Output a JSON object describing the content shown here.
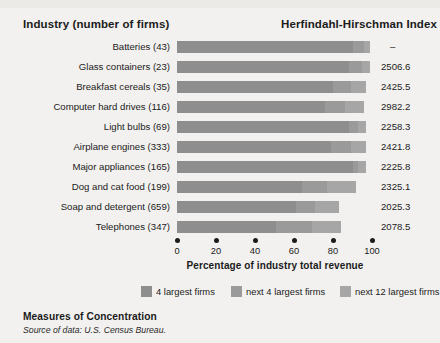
{
  "header": {
    "left": "Industry (number of firms)",
    "right": "Herfindahl-Hirschman Index"
  },
  "caption": {
    "title": "Measures of Concentration",
    "source": "Source of data: U.S. Census Bureau."
  },
  "axis": {
    "title": "Percentage of industry total revenue",
    "ticks": [
      "0",
      "20",
      "40",
      "60",
      "80",
      "100"
    ]
  },
  "legend": {
    "items": [
      {
        "label": "4 largest firms",
        "color": "#8e8e8e"
      },
      {
        "label": "next 4 largest firms",
        "color": "#9a9a9a"
      },
      {
        "label": "next 12 largest firms",
        "color": "#a6a6a6"
      }
    ]
  },
  "chart_data": {
    "type": "bar",
    "subtype": "stacked-horizontal",
    "title": "Measures of Concentration",
    "xlabel": "Percentage of industry total revenue",
    "ylabel": "Industry (number of firms)",
    "xlim": [
      0,
      100
    ],
    "xticks": [
      0,
      20,
      40,
      60,
      80,
      100
    ],
    "grid": false,
    "legend_position": "bottom",
    "categories": [
      "Batteries  (43)",
      "Glass containers  (23)",
      "Breakfast cereals  (35)",
      "Computer hard drives  (116)",
      "Light bulbs  (69)",
      "Airplane engines  (333)",
      "Major appliances  (165)",
      "Dog and cat food  (199)",
      "Soap and detergent  (659)",
      "Telephones  (347)"
    ],
    "series": [
      {
        "name": "4 largest firms",
        "values": [
          90,
          88,
          80,
          76,
          88,
          79,
          90,
          64,
          61,
          51
        ]
      },
      {
        "name": "next 4 largest firms",
        "values": [
          6,
          7,
          9,
          10,
          5,
          10,
          3,
          13,
          10,
          18
        ]
      },
      {
        "name": "next 12 largest firms",
        "values": [
          3,
          4,
          8,
          10,
          4,
          8,
          4,
          15,
          12,
          15
        ]
      }
    ],
    "rows": [
      {
        "industry": "Batteries",
        "firms": "43",
        "s1": 90,
        "s2": 6,
        "s3": 3,
        "hhi": "–"
      },
      {
        "industry": "Glass containers",
        "firms": "23",
        "s1": 88,
        "s2": 7,
        "s3": 4,
        "hhi": "2506.6"
      },
      {
        "industry": "Breakfast cereals",
        "firms": "35",
        "s1": 80,
        "s2": 9,
        "s3": 8,
        "hhi": "2425.5"
      },
      {
        "industry": "Computer hard drives",
        "firms": "116",
        "s1": 76,
        "s2": 10,
        "s3": 10,
        "hhi": "2982.2"
      },
      {
        "industry": "Light bulbs",
        "firms": "69",
        "s1": 88,
        "s2": 5,
        "s3": 4,
        "hhi": "2258.3"
      },
      {
        "industry": "Airplane engines",
        "firms": "333",
        "s1": 79,
        "s2": 10,
        "s3": 8,
        "hhi": "2421.8"
      },
      {
        "industry": "Major appliances",
        "firms": "165",
        "s1": 90,
        "s2": 3,
        "s3": 4,
        "hhi": "2225.8"
      },
      {
        "industry": "Dog and cat food",
        "firms": "199",
        "s1": 64,
        "s2": 13,
        "s3": 15,
        "hhi": "2325.1"
      },
      {
        "industry": "Soap and detergent",
        "firms": "659",
        "s1": 61,
        "s2": 10,
        "s3": 12,
        "hhi": "2025.3"
      },
      {
        "industry": "Telephones",
        "firms": "347",
        "s1": 51,
        "s2": 18,
        "s3": 15,
        "hhi": "2078.5"
      }
    ],
    "hhi_values": [
      "–",
      "2506.6",
      "2425.5",
      "2982.2",
      "2258.3",
      "2421.8",
      "2225.8",
      "2325.1",
      "2025.3",
      "2078.5"
    ]
  }
}
